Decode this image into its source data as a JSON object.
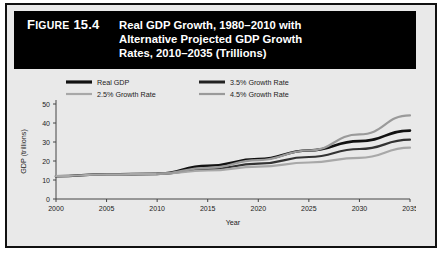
{
  "figure": {
    "label_prefix": "Figure",
    "number": "15.4",
    "title_lines": [
      "Real GDP Growth, 1980–2010 with",
      "Alternative Projected GDP Growth",
      "Rates, 2010–2035 (Trillions)"
    ],
    "banner_color": "#000000",
    "background_color": "#e9e9e9"
  },
  "chart_data": {
    "type": "line",
    "title": "Real GDP Growth, 1980–2010 with Alternative Projected GDP Growth Rates, 2010–2035 (Trillions)",
    "xlabel": "Year",
    "ylabel": "GDP (trillions)",
    "xlim": [
      2000,
      2035
    ],
    "ylim": [
      0,
      50
    ],
    "xticks": [
      2000,
      2005,
      2010,
      2015,
      2020,
      2025,
      2030,
      2035
    ],
    "yticks": [
      0,
      10,
      20,
      30,
      40,
      50
    ],
    "grid": false,
    "legend_position": "top",
    "x": [
      2000,
      2005,
      2010,
      2015,
      2020,
      2025,
      2030,
      2035
    ],
    "series": [
      {
        "name": "Real GDP",
        "color": "#111111",
        "width": 2.6,
        "values": [
          12.0,
          13.0,
          13.2,
          17.5,
          21.0,
          25.5,
          30.5,
          36.0
        ]
      },
      {
        "name": "3.5% Growth Rate",
        "color": "#333333",
        "width": 2.2,
        "values": [
          null,
          null,
          13.2,
          15.7,
          18.6,
          22.1,
          26.3,
          31.2
        ]
      },
      {
        "name": "2.5% Growth Rate",
        "color": "#a8a8a8",
        "width": 2.2,
        "values": [
          12.0,
          13.0,
          13.2,
          15.0,
          17.0,
          19.2,
          21.7,
          27.0
        ]
      },
      {
        "name": "4.5% Growth Rate",
        "color": "#9a9a9a",
        "width": 2.2,
        "values": [
          null,
          null,
          13.2,
          16.4,
          20.5,
          25.5,
          34.0,
          44.0
        ]
      }
    ],
    "legend": [
      {
        "label": "Real GDP",
        "color": "#111111",
        "width": 3.2
      },
      {
        "label": "3.5% Growth Rate",
        "color": "#222222",
        "width": 3.0
      },
      {
        "label": "2.5% Growth Rate",
        "color": "#a8a8a8",
        "width": 2.2
      },
      {
        "label": "4.5% Growth Rate",
        "color": "#9a9a9a",
        "width": 2.2
      }
    ]
  }
}
